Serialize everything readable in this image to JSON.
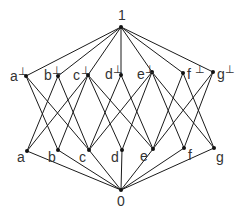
{
  "diagram": {
    "type": "hasse-diagram",
    "colors": {
      "edge": "#1a1a1a",
      "node": "#111111",
      "label": "#333333",
      "background": "#ffffff"
    },
    "nodes": [
      {
        "id": "top",
        "label": "1",
        "sup": "",
        "x": 121,
        "y": 27,
        "lx": 118,
        "ly": 20
      },
      {
        "id": "a_perp",
        "label": "a",
        "sup": "⊥",
        "x": 26,
        "y": 76,
        "lx": 10,
        "ly": 81
      },
      {
        "id": "b_perp",
        "label": "b",
        "sup": "⊥",
        "x": 58,
        "y": 76,
        "lx": 44,
        "ly": 80
      },
      {
        "id": "c_perp",
        "label": "c",
        "sup": "⊥",
        "x": 88,
        "y": 75,
        "lx": 73,
        "ly": 80
      },
      {
        "id": "d_perp",
        "label": "d",
        "sup": "⊥",
        "x": 121,
        "y": 75,
        "lx": 105,
        "ly": 79
      },
      {
        "id": "e_perp",
        "label": "e",
        "sup": "⊥",
        "x": 152,
        "y": 72,
        "lx": 137,
        "ly": 79
      },
      {
        "id": "f_perp",
        "label": "f",
        "sup": "⊥",
        "x": 183,
        "y": 73,
        "lx": 187,
        "ly": 79
      },
      {
        "id": "g_perp",
        "label": "g",
        "sup": "⊥",
        "x": 213,
        "y": 72,
        "lx": 217,
        "ly": 79
      },
      {
        "id": "a",
        "label": "a",
        "sup": "",
        "x": 27,
        "y": 151,
        "lx": 17,
        "ly": 162
      },
      {
        "id": "b",
        "label": "b",
        "sup": "",
        "x": 58,
        "y": 150,
        "lx": 48,
        "ly": 162
      },
      {
        "id": "c",
        "label": "c",
        "sup": "",
        "x": 89,
        "y": 150,
        "lx": 79,
        "ly": 162
      },
      {
        "id": "d",
        "label": "d",
        "sup": "",
        "x": 122,
        "y": 150,
        "lx": 111,
        "ly": 162
      },
      {
        "id": "e",
        "label": "e",
        "sup": "",
        "x": 153,
        "y": 149,
        "lx": 140,
        "ly": 161
      },
      {
        "id": "f",
        "label": "f",
        "sup": "",
        "x": 184,
        "y": 148,
        "lx": 188,
        "ly": 160
      },
      {
        "id": "g",
        "label": "g",
        "sup": "",
        "x": 214,
        "y": 148,
        "lx": 216,
        "ly": 162
      },
      {
        "id": "bottom",
        "label": "0",
        "sup": "",
        "x": 121,
        "y": 190,
        "lx": 117,
        "ly": 206
      }
    ],
    "edges": [
      [
        "top",
        "a_perp"
      ],
      [
        "top",
        "b_perp"
      ],
      [
        "top",
        "c_perp"
      ],
      [
        "top",
        "d_perp"
      ],
      [
        "top",
        "e_perp"
      ],
      [
        "top",
        "f_perp"
      ],
      [
        "top",
        "g_perp"
      ],
      [
        "a_perp",
        "b"
      ],
      [
        "a_perp",
        "c"
      ],
      [
        "b_perp",
        "a"
      ],
      [
        "b_perp",
        "c"
      ],
      [
        "c_perp",
        "a"
      ],
      [
        "c_perp",
        "b"
      ],
      [
        "c_perp",
        "d"
      ],
      [
        "c_perp",
        "e"
      ],
      [
        "d_perp",
        "c"
      ],
      [
        "d_perp",
        "e"
      ],
      [
        "e_perp",
        "c"
      ],
      [
        "e_perp",
        "d"
      ],
      [
        "e_perp",
        "f"
      ],
      [
        "e_perp",
        "g"
      ],
      [
        "f_perp",
        "e"
      ],
      [
        "f_perp",
        "g"
      ],
      [
        "g_perp",
        "e"
      ],
      [
        "g_perp",
        "f"
      ],
      [
        "bottom",
        "a"
      ],
      [
        "bottom",
        "b"
      ],
      [
        "bottom",
        "c"
      ],
      [
        "bottom",
        "d"
      ],
      [
        "bottom",
        "e"
      ],
      [
        "bottom",
        "f"
      ],
      [
        "bottom",
        "g"
      ]
    ]
  }
}
